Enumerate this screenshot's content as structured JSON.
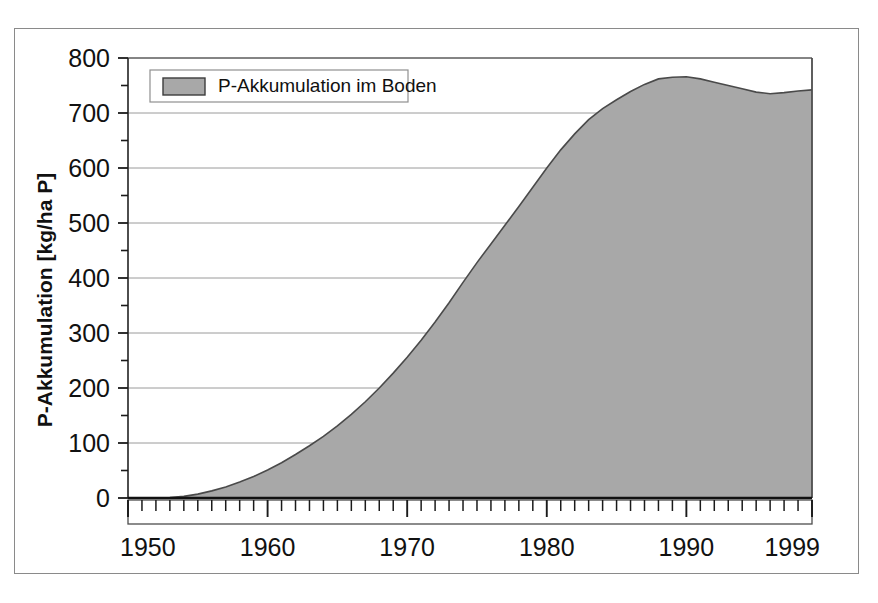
{
  "chart_data": {
    "type": "area",
    "title": "",
    "xlabel": "",
    "ylabel": "P-Akkumulation [kg/ha P]",
    "xlim": [
      1950,
      1999
    ],
    "ylim": [
      0,
      800
    ],
    "grid": true,
    "legend_position": "top-left",
    "series": [
      {
        "name": "P-Akkumulation im Boden",
        "color": "#a8a8a8",
        "line_color": "#4a4a4a",
        "x": [
          1950,
          1951,
          1952,
          1953,
          1954,
          1955,
          1956,
          1957,
          1958,
          1959,
          1960,
          1961,
          1962,
          1963,
          1964,
          1965,
          1966,
          1967,
          1968,
          1969,
          1970,
          1971,
          1972,
          1973,
          1974,
          1975,
          1976,
          1977,
          1978,
          1979,
          1980,
          1981,
          1982,
          1983,
          1984,
          1985,
          1986,
          1987,
          1988,
          1989,
          1990,
          1991,
          1992,
          1993,
          1994,
          1995,
          1996,
          1997,
          1998,
          1999
        ],
        "values": [
          0,
          0,
          0,
          1,
          3,
          7,
          13,
          20,
          29,
          39,
          51,
          64,
          79,
          95,
          112,
          131,
          152,
          175,
          200,
          227,
          256,
          287,
          320,
          355,
          392,
          428,
          462,
          496,
          530,
          565,
          600,
          633,
          662,
          688,
          708,
          724,
          739,
          752,
          762,
          765,
          766,
          762,
          756,
          750,
          744,
          738,
          735,
          737,
          740,
          742
        ]
      }
    ],
    "x_ticks_major": [
      1950,
      1960,
      1970,
      1980,
      1990,
      1999
    ],
    "x_tick_labels": [
      "1950",
      "1960",
      "1970",
      "1980",
      "1990",
      "1999"
    ],
    "x_ticks_minor_step": 1,
    "y_ticks_major": [
      0,
      100,
      200,
      300,
      400,
      500,
      600,
      700,
      800
    ],
    "y_tick_labels": [
      "0",
      "100",
      "200",
      "300",
      "400",
      "500",
      "600",
      "700",
      "800"
    ],
    "y_ticks_minor_step": 50
  },
  "legend": {
    "entries": [
      {
        "label": "P-Akkumulation im Boden",
        "swatch_color": "#a8a8a8"
      }
    ]
  },
  "axes": {
    "y_title": "P-Akkumulation [kg/ha P]"
  },
  "colors": {
    "fill": "#a8a8a8",
    "line": "#4a4a4a",
    "grid": "#9a9a9a",
    "axis": "#1a1a1a",
    "frame": "#8a8a8a",
    "background": "#ffffff"
  }
}
